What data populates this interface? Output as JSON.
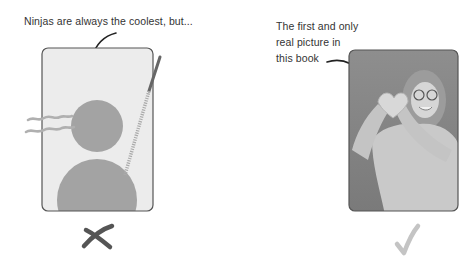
{
  "left_panel": {
    "caption": "Ninjas are always the coolest, but...",
    "illustration": "ninja-silhouette-drawing",
    "verdict_icon": "cross-icon"
  },
  "right_panel": {
    "caption_lines": [
      "The first and only",
      "real picture in",
      "this book"
    ],
    "photo": "woman-making-heart-hands-photo",
    "verdict_icon": "checkmark-icon"
  },
  "colors": {
    "frame_fill_left": "#ececec",
    "figure_gray": "#a3a3a3",
    "frame_border": "#555555",
    "photo_bg": "#8a8a8a",
    "cross": "#555555",
    "check": "#c4c4c4"
  }
}
